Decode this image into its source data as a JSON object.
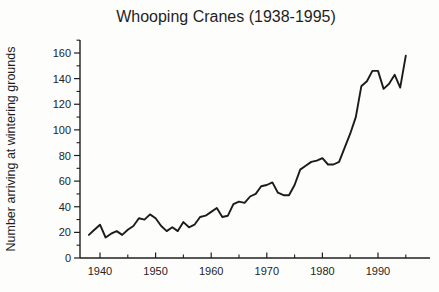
{
  "chart_data": {
    "type": "line",
    "title": "Whooping Cranes (1938-1995)",
    "xlabel": "",
    "ylabel": "Number arriving at wintering grounds",
    "x": [
      1938,
      1939,
      1940,
      1941,
      1942,
      1943,
      1944,
      1945,
      1946,
      1947,
      1948,
      1949,
      1950,
      1951,
      1952,
      1953,
      1954,
      1955,
      1956,
      1957,
      1958,
      1959,
      1960,
      1961,
      1962,
      1963,
      1964,
      1965,
      1966,
      1967,
      1968,
      1969,
      1970,
      1971,
      1972,
      1973,
      1974,
      1975,
      1976,
      1977,
      1978,
      1979,
      1980,
      1981,
      1982,
      1983,
      1984,
      1985,
      1986,
      1987,
      1988,
      1989,
      1990,
      1991,
      1992,
      1993,
      1994,
      1995
    ],
    "y": [
      18,
      22,
      26,
      16,
      19,
      21,
      18,
      22,
      25,
      31,
      30,
      34,
      31,
      25,
      21,
      24,
      21,
      28,
      24,
      26,
      32,
      33,
      36,
      39,
      32,
      33,
      42,
      44,
      43,
      48,
      50,
      56,
      57,
      59,
      51,
      49,
      49,
      57,
      69,
      72,
      75,
      76,
      78,
      73,
      73,
      75,
      86,
      97,
      110,
      134,
      138,
      146,
      146,
      132,
      136,
      143,
      133,
      158
    ],
    "xlim": [
      1937.5,
      1999.5
    ],
    "ylim": [
      0,
      170
    ],
    "x_major_ticks": [
      1940,
      1950,
      1960,
      1970,
      1980,
      1990
    ],
    "x_minor_ticks": [
      1945,
      1955,
      1965,
      1975,
      1985,
      1995
    ],
    "y_major_ticks": [
      0,
      20,
      40,
      60,
      80,
      100,
      120,
      140,
      160
    ],
    "y_minor_ticks": [
      10,
      30,
      50,
      70,
      90,
      110,
      130,
      150,
      170
    ],
    "grid": false,
    "legend": false,
    "line_color": "#1b1b1b",
    "axis_color": "#1f1f1f",
    "text_color": "#242424",
    "background": "#fdfdfc"
  }
}
